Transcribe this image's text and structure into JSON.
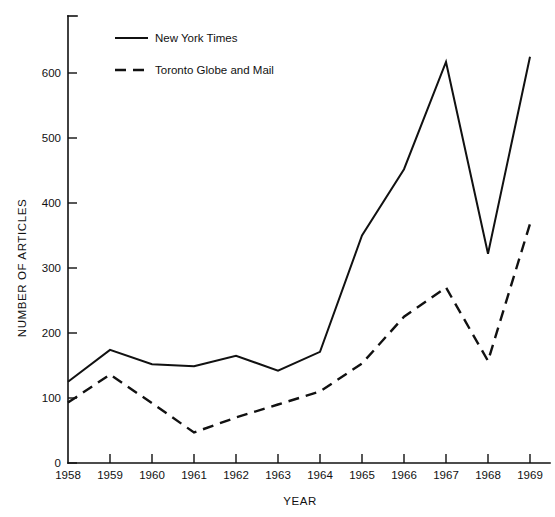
{
  "chart_data": {
    "type": "line",
    "title": "",
    "xlabel": "YEAR",
    "ylabel": "NUMBER OF ARTICLES",
    "categories": [
      1958,
      1959,
      1960,
      1961,
      1962,
      1963,
      1964,
      1965,
      1966,
      1967,
      1968,
      1969
    ],
    "x_tick_labels": [
      "1958",
      "1959",
      "1960",
      "1961",
      "1962",
      "1963",
      "1964",
      "1965",
      "1966",
      "1967",
      "1968",
      "1969"
    ],
    "y_tick_labels": [
      "0",
      "100",
      "200",
      "300",
      "400",
      "500",
      "600"
    ],
    "y_ticks": [
      0,
      100,
      200,
      300,
      400,
      500,
      600
    ],
    "xlim": [
      1958,
      1969
    ],
    "ylim": [
      0,
      660
    ],
    "grid": false,
    "legend_position": "top-left-inside",
    "series": [
      {
        "name": "New York Times",
        "style": "solid",
        "color": "#111111",
        "values": [
          125,
          174,
          152,
          149,
          165,
          142,
          171,
          350,
          452,
          617,
          322,
          625
        ]
      },
      {
        "name": "Toronto Globe and Mail",
        "style": "dashed",
        "color": "#111111",
        "values": [
          93,
          136,
          92,
          47,
          70,
          90,
          110,
          153,
          225,
          270,
          157,
          368
        ]
      }
    ]
  },
  "legend": {
    "entries": [
      {
        "label": "New York Times"
      },
      {
        "label": "Toronto Globe and Mail"
      }
    ]
  },
  "axes": {
    "x_title": "YEAR",
    "y_title": "NUMBER OF ARTICLES"
  }
}
